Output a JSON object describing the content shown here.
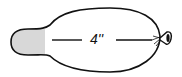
{
  "diagram": {
    "measurement_label": "4''",
    "colors": {
      "outline": "#111111",
      "fill": "#ffffff",
      "tip_shading": "#d8d8d8"
    }
  }
}
